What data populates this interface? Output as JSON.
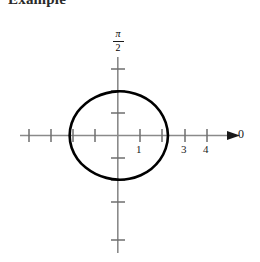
{
  "caption": {
    "text": "Example",
    "note": "bold heading clipped at the top edge of the screenshot"
  },
  "figure": {
    "name": "polar-plot",
    "background_color": "#ffffff",
    "axis_color": "#808080",
    "curve_color": "#000000",
    "label_color": "#1a1a1a"
  },
  "axes": {
    "horizontal": {
      "name": "polar-axis-theta-0",
      "end_label": "0",
      "arrow": true,
      "tick_labels": [
        "1",
        "3",
        "4"
      ]
    },
    "vertical": {
      "name": "polar-axis-theta-pi-over-2",
      "top_label_numerator": "π",
      "top_label_denominator": "2"
    }
  },
  "chart_data": {
    "type": "line",
    "title": "",
    "subtitle": "",
    "xlabel": "0",
    "ylabel": "π/2",
    "coordinate_system": "polar",
    "grid": false,
    "legend": null,
    "xlim": [
      -4.4,
      4.9
    ],
    "ylim": [
      -4.0,
      3.5
    ],
    "x_ticks": [
      -4,
      -3,
      -2,
      -1,
      1,
      2,
      3,
      4
    ],
    "x_tick_labels": [
      "",
      "",
      "",
      "",
      "1",
      "",
      "3",
      "4"
    ],
    "y_ticks": [
      -4,
      -3,
      -2,
      -1,
      1,
      2,
      3
    ],
    "y_tick_labels": [
      "",
      "",
      "",
      "",
      "",
      "",
      ""
    ],
    "annotations": [
      {
        "text": "0",
        "x": 4.9,
        "y": 0.1
      },
      {
        "text": "π/2",
        "x": -0.35,
        "y": 3.45
      }
    ],
    "series": [
      {
        "name": "r = 1 + cos(theta) scaled limacon (convex oval)",
        "curve": "closed",
        "stroke_width": 2.6,
        "theta_degrees": [
          0,
          15,
          30,
          45,
          60,
          75,
          90,
          105,
          120,
          135,
          150,
          165,
          180,
          195,
          210,
          225,
          240,
          255,
          270,
          285,
          300,
          315,
          330,
          345,
          360
        ],
        "r": [
          2.25,
          2.23,
          2.18,
          2.12,
          2.06,
          2.01,
          1.98,
          1.97,
          1.99,
          2.03,
          2.09,
          2.14,
          2.16,
          2.14,
          2.09,
          2.03,
          1.99,
          1.97,
          1.98,
          2.01,
          2.06,
          2.12,
          2.18,
          2.23,
          2.25
        ],
        "x": [
          2.25,
          2.15,
          1.89,
          1.5,
          1.03,
          0.52,
          0.0,
          -0.51,
          -1.0,
          -1.44,
          -1.81,
          -2.07,
          -2.16,
          -2.07,
          -1.81,
          -1.44,
          -1.0,
          -0.51,
          0.0,
          0.52,
          1.03,
          1.5,
          1.89,
          2.15,
          2.25
        ],
        "y": [
          0.0,
          0.58,
          1.09,
          1.5,
          1.78,
          1.94,
          1.98,
          1.9,
          1.72,
          1.44,
          1.05,
          0.55,
          0.0,
          -0.55,
          -1.05,
          -1.44,
          -1.72,
          -1.9,
          -1.98,
          -1.94,
          -1.78,
          -1.5,
          -1.09,
          -0.58,
          0.0
        ]
      }
    ]
  }
}
